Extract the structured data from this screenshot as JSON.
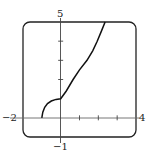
{
  "chart_data": {
    "type": "line",
    "title": "",
    "xlabel": "",
    "ylabel": "",
    "xlim": [
      -2,
      4
    ],
    "ylim": [
      -1,
      5
    ],
    "grid": false,
    "tick_labels": {
      "x_min": "−2",
      "x_max": "4",
      "y_min": "−1",
      "y_max": "5"
    },
    "x_ticks": [
      1,
      2,
      3
    ],
    "y_ticks": [
      2,
      3,
      4
    ],
    "series": [
      {
        "name": "curve",
        "x": [
          -1,
          -0.95,
          -0.85,
          -0.7,
          -0.5,
          -0.25,
          0,
          0.3,
          0.66,
          1.0,
          1.4,
          1.7,
          1.94,
          2.15,
          2.36
        ],
        "y": [
          0,
          0.3,
          0.55,
          0.75,
          0.88,
          0.96,
          1.0,
          1.4,
          2.0,
          2.5,
          3.0,
          3.5,
          4.0,
          4.5,
          5.0
        ]
      }
    ]
  }
}
